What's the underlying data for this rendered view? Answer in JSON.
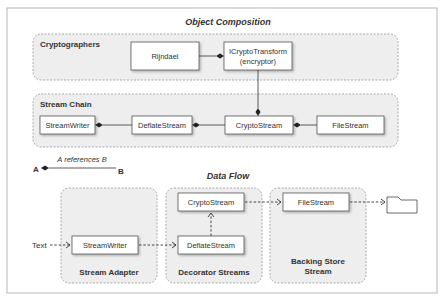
{
  "composition": {
    "title": "Object Composition",
    "groups": {
      "cryptographers": {
        "label": "Cryptographers"
      },
      "stream_chain": {
        "label": "Stream Chain"
      }
    },
    "boxes": {
      "rijndael": "Rijndael",
      "icrypto_line1": "ICryptoTransform",
      "icrypto_line2": "(encryptor)",
      "streamwriter": "StreamWriter",
      "deflatestream": "DeflateStream",
      "cryptostream": "CryptoStream",
      "filestream": "FileStream"
    }
  },
  "legend": {
    "a": "A",
    "b": "B",
    "text": "A references B"
  },
  "dataflow": {
    "title": "Data Flow",
    "input_label": "Text",
    "groups": {
      "stream_adapter": "Stream Adapter",
      "decorator_streams": "Decorator Streams",
      "backing_store_line1": "Backing Store",
      "backing_store_line2": "Stream"
    },
    "boxes": {
      "streamwriter": "StreamWriter",
      "deflatestream": "DeflateStream",
      "cryptostream": "CryptoStream",
      "filestream": "FileStream"
    },
    "sink_icon": "folder-icon"
  },
  "colors": {
    "group_fill": "#eeeeee",
    "group_border": "#999999",
    "box_border": "#555555",
    "line": "#333333",
    "outer_border": "#b5b5b5"
  }
}
